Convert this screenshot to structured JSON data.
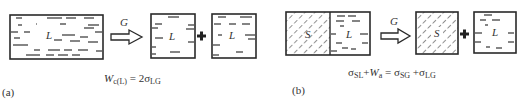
{
  "panel_a": {
    "caption": "(a)",
    "liquid_label": "L",
    "arrow_label": "G",
    "eq": {
      "W": "W",
      "W_sub": "c(L)",
      "eq_part": " = 2σ",
      "sigma_sub": "LG"
    },
    "description": "Work of cohesion: a liquid column separated into two liquid pieces creating two LG interfaces"
  },
  "panel_b": {
    "caption": "(b)",
    "solid_label": "S",
    "liquid_label": "L",
    "arrow_label": "G",
    "eq": {
      "s1": "σ",
      "s1_sub": "SL",
      "plus1": "+",
      "W": "W",
      "W_sub": "a",
      "equals": " = σ",
      "s2_sub": "SG",
      "plus2": " +σ",
      "s3_sub": "LG"
    },
    "description": "Work of adhesion: solid-liquid pair separated into a solid and a liquid"
  },
  "colors": {
    "stroke": "#2a2a2a",
    "text": "#333333",
    "background": "#ffffff"
  }
}
